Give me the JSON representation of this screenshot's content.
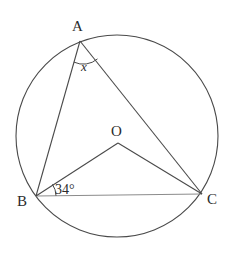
{
  "figure": {
    "background_color": "#ffffff",
    "stroke_color": "#4a4a4a",
    "chord_color": "#8c8c8c",
    "label_color": "#2b2b2b",
    "circle": {
      "name": "circumscribed-circle",
      "cx": 117,
      "cy": 136,
      "r": 101
    },
    "points": [
      {
        "id": "A",
        "label": "A",
        "x": 80,
        "y": 41,
        "label_x": 72,
        "label_y": 31
      },
      {
        "id": "B",
        "label": "B",
        "x": 36,
        "y": 196,
        "label_x": 17,
        "label_y": 206
      },
      {
        "id": "C",
        "label": "C",
        "x": 202,
        "y": 194,
        "label_x": 207,
        "label_y": 204
      },
      {
        "id": "O",
        "label": "O",
        "x": 118,
        "y": 143,
        "label_x": 111,
        "label_y": 136
      }
    ],
    "segments": [
      {
        "name": "segment-AB",
        "from": "A",
        "to": "B"
      },
      {
        "name": "segment-AC",
        "from": "A",
        "to": "C"
      },
      {
        "name": "segment-BC",
        "from": "B",
        "to": "C"
      },
      {
        "name": "segment-OB",
        "from": "O",
        "to": "B"
      },
      {
        "name": "segment-OC",
        "from": "O",
        "to": "C"
      }
    ],
    "angles": [
      {
        "name": "angle-at-A",
        "vertex": "A",
        "label": "x",
        "label_x": 81,
        "label_y": 71,
        "arc_radius": 22,
        "unknown": true
      },
      {
        "name": "angle-at-B",
        "vertex": "B",
        "label": "34°",
        "value": 34,
        "unit": "degrees",
        "label_x": 55,
        "label_y": 194,
        "arc_radius": 20,
        "unknown": false
      }
    ]
  }
}
